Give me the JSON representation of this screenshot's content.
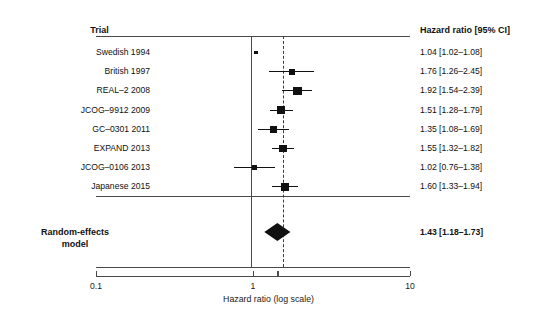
{
  "columns": {
    "trial_header": "Trial",
    "hr_header": "Hazard ratio [95% CI]"
  },
  "axis": {
    "title": "Hazard ratio (log scale)",
    "ticks": [
      "0.1",
      "1",
      "10"
    ],
    "scale": "log",
    "min": 0.1,
    "max": 10
  },
  "reference_lines": {
    "null_value": 1,
    "pooled_value": 1.43
  },
  "pooled": {
    "label_line1": "Random-effects",
    "label_line2": "model",
    "hr_text": "1.43 [1.18–1.73]",
    "estimate": 1.43,
    "lower": 1.18,
    "upper": 1.73
  },
  "colors": {
    "marker": "#111111",
    "rule": "#4a4a4a",
    "text": "#1a1a1a"
  },
  "chart_data": {
    "type": "forest",
    "title": "",
    "xlabel": "Hazard ratio (log scale)",
    "ylabel": "",
    "xscale": "log",
    "xlim": [
      0.1,
      10
    ],
    "xticks": [
      0.1,
      1,
      10
    ],
    "grid": false,
    "reference_line": 1,
    "pooled_line": 1.43,
    "categories": [
      "Swedish 1994",
      "British 1997",
      "REAL–2 2008",
      "JCOG–9912 2009",
      "GC–0301 2011",
      "EXPAND 2013",
      "JCOG–0106 2013",
      "Japanese 2015"
    ],
    "studies": [
      {
        "label": "Swedish 1994",
        "hr_text": "1.04 [1.02–1.08]",
        "estimate": 1.04,
        "lower": 1.02,
        "upper": 1.08,
        "weight": 0.1
      },
      {
        "label": "British 1997",
        "hr_text": "1.76 [1.26–2.45]",
        "estimate": 1.76,
        "lower": 1.26,
        "upper": 2.45,
        "weight": 0.55
      },
      {
        "label": "REAL–2 2008",
        "hr_text": "1.92 [1.54–2.39]",
        "estimate": 1.92,
        "lower": 1.54,
        "upper": 2.39,
        "weight": 1.0
      },
      {
        "label": "JCOG–9912 2009",
        "hr_text": "1.51 [1.28–1.79]",
        "estimate": 1.51,
        "lower": 1.28,
        "upper": 1.79,
        "weight": 0.85
      },
      {
        "label": "GC–0301 2011",
        "hr_text": "1.35 [1.08–1.69]",
        "estimate": 1.35,
        "lower": 1.08,
        "upper": 1.69,
        "weight": 0.62
      },
      {
        "label": "EXPAND 2013",
        "hr_text": "1.55 [1.32–1.82]",
        "estimate": 1.55,
        "lower": 1.32,
        "upper": 1.82,
        "weight": 0.88
      },
      {
        "label": "JCOG–0106 2013",
        "hr_text": "1.02 [0.76–1.38]",
        "estimate": 1.02,
        "lower": 0.76,
        "upper": 1.38,
        "weight": 0.45
      },
      {
        "label": "Japanese 2015",
        "hr_text": "1.60 [1.33–1.94]",
        "estimate": 1.6,
        "lower": 1.33,
        "upper": 1.94,
        "weight": 0.88
      }
    ],
    "summary": {
      "label": "Random-effects model",
      "hr_text": "1.43 [1.18–1.73]",
      "estimate": 1.43,
      "lower": 1.18,
      "upper": 1.73
    }
  }
}
